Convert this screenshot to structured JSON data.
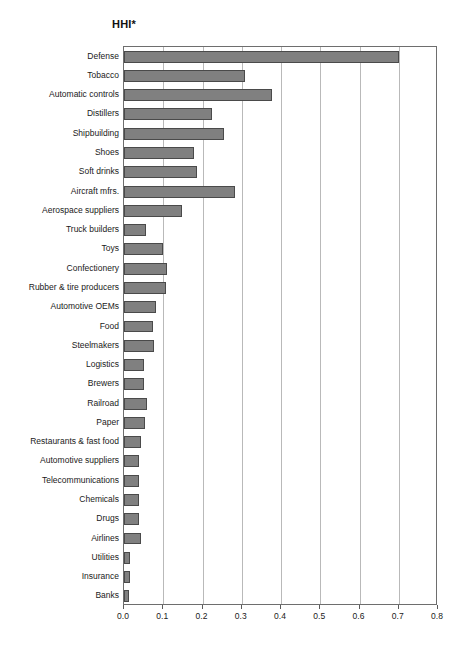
{
  "chart_data": {
    "type": "bar",
    "orientation": "horizontal",
    "title": "HHI*",
    "xlabel": "",
    "ylabel": "",
    "xlim": [
      0.0,
      0.8
    ],
    "grid": true,
    "legend": null,
    "xticks": [
      "0.0",
      "0.1",
      "0.2",
      "0.3",
      "0.4",
      "0.5",
      "0.6",
      "0.7",
      "0.8"
    ],
    "xtick_values": [
      0.0,
      0.1,
      0.2,
      0.3,
      0.4,
      0.5,
      0.6,
      0.7,
      0.8
    ],
    "bar_color": "#808080",
    "bar_edge_color": "#4a4a4a",
    "categories": [
      "Defense",
      "Tobacco",
      "Automatic controls",
      "Distillers",
      "Shipbuilding",
      "Shoes",
      "Soft drinks",
      "Aircraft mfrs.",
      "Aerospace suppliers",
      "Truck builders",
      "Toys",
      "Confectionery",
      "Rubber & tire producers",
      "Automotive OEMs",
      "Food",
      "Steelmakers",
      "Logistics",
      "Brewers",
      "Railroad",
      "Paper",
      "Restaurants & fast food",
      "Automotive suppliers",
      "Telecommunications",
      "Chemicals",
      "Drugs",
      "Airlines",
      "Utilities",
      "Insurance",
      "Banks"
    ],
    "values": [
      0.7,
      0.308,
      0.377,
      0.224,
      0.255,
      0.178,
      0.186,
      0.283,
      0.148,
      0.056,
      0.099,
      0.11,
      0.107,
      0.082,
      0.074,
      0.076,
      0.051,
      0.051,
      0.059,
      0.054,
      0.043,
      0.039,
      0.037,
      0.037,
      0.039,
      0.043,
      0.015,
      0.015,
      0.013
    ]
  }
}
